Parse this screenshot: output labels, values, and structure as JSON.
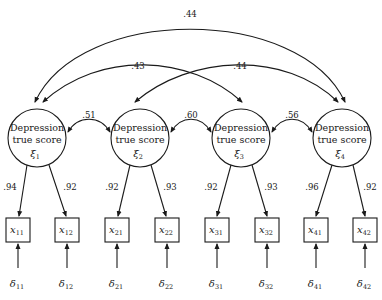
{
  "diagram": {
    "type": "confirmatory factor model (path diagram)",
    "latent_factors": [
      {
        "id": "xi1",
        "line1": "Depression",
        "line2": "true score",
        "symbol": "ξ",
        "sub": "1",
        "cx": 37,
        "cy": 138
      },
      {
        "id": "xi2",
        "line1": "Depression",
        "line2": "true score",
        "symbol": "ξ",
        "sub": "2",
        "cx": 140,
        "cy": 138
      },
      {
        "id": "xi3",
        "line1": "Depression",
        "line2": "true score",
        "symbol": "ξ",
        "sub": "3",
        "cx": 241,
        "cy": 138
      },
      {
        "id": "xi4",
        "line1": "Depression",
        "line2": "true score",
        "symbol": "ξ",
        "sub": "4",
        "cx": 342,
        "cy": 138
      }
    ],
    "indicators": [
      {
        "symbol": "x",
        "sub": "11",
        "x": 6
      },
      {
        "symbol": "x",
        "sub": "12",
        "x": 55
      },
      {
        "symbol": "x",
        "sub": "21",
        "x": 105
      },
      {
        "symbol": "x",
        "sub": "22",
        "x": 155
      },
      {
        "symbol": "x",
        "sub": "31",
        "x": 205
      },
      {
        "symbol": "x",
        "sub": "32",
        "x": 255
      },
      {
        "symbol": "x",
        "sub": "41",
        "x": 304
      },
      {
        "symbol": "x",
        "sub": "42",
        "x": 353
      }
    ],
    "errors": [
      {
        "symbol": "δ",
        "sub": "11"
      },
      {
        "symbol": "δ",
        "sub": "12"
      },
      {
        "symbol": "δ",
        "sub": "21"
      },
      {
        "symbol": "δ",
        "sub": "22"
      },
      {
        "symbol": "δ",
        "sub": "31"
      },
      {
        "symbol": "δ",
        "sub": "32"
      },
      {
        "symbol": "δ",
        "sub": "41"
      },
      {
        "symbol": "δ",
        "sub": "42"
      }
    ],
    "loadings": [
      ".94",
      ".92",
      ".92",
      ".93",
      ".92",
      ".93",
      ".96",
      ".92"
    ],
    "adjacent_correlations": [
      {
        "from": "xi1",
        "to": "xi2",
        "value": ".51"
      },
      {
        "from": "xi2",
        "to": "xi3",
        "value": ".60"
      },
      {
        "from": "xi3",
        "to": "xi4",
        "value": ".56"
      }
    ],
    "long_correlations": [
      {
        "from": "xi1",
        "to": "xi4",
        "value": ".44"
      },
      {
        "from": "xi1",
        "to": "xi3",
        "value": ".43"
      },
      {
        "from": "xi2",
        "to": "xi4",
        "value": ".44"
      }
    ]
  }
}
